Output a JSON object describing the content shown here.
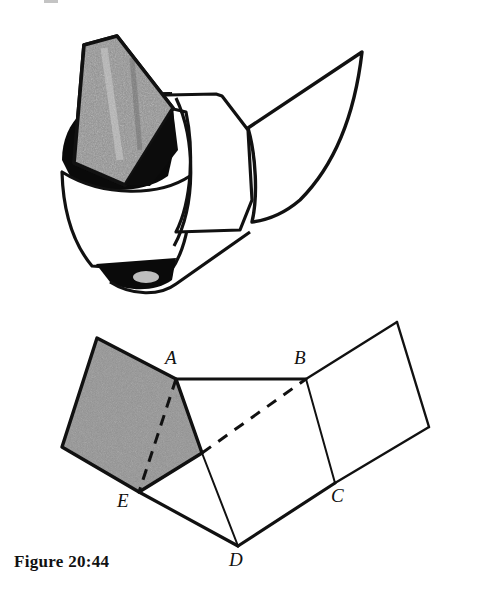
{
  "figure": {
    "caption": "Figure 20:44",
    "kind": "geometry-illustration",
    "panels": [
      {
        "name": "photo-model",
        "description": "folded paper model, perspective view"
      },
      {
        "name": "line-diagram",
        "description": "labelled net diagram of the folded model"
      }
    ]
  },
  "colors": {
    "ink": "#111111",
    "shaded_face": "#8d8d8d",
    "shadow_black": "#0a0a0a",
    "paper": "#ffffff",
    "texture_light": "#b9b9b9",
    "texture_dark": "#6a6a6a"
  },
  "diagram": {
    "vertices": [
      {
        "id": "A",
        "label": "A",
        "x": 176,
        "y": 379,
        "label_x": 165,
        "label_y": 351
      },
      {
        "id": "B",
        "label": "B",
        "x": 306,
        "y": 379,
        "label_x": 294,
        "label_y": 351
      },
      {
        "id": "C",
        "label": "C",
        "x": 335,
        "y": 483,
        "label_x": 331,
        "label_y": 489
      },
      {
        "id": "D",
        "label": "D",
        "x": 238,
        "y": 546,
        "label_x": 230,
        "label_y": 552
      },
      {
        "id": "E",
        "label": "E",
        "x": 139,
        "y": 492,
        "label_x": 118,
        "label_y": 494
      }
    ],
    "unlabelled_points": [
      {
        "id": "P_top",
        "x": 97,
        "y": 338
      },
      {
        "id": "P_left",
        "x": 62,
        "y": 447
      },
      {
        "id": "P_mid",
        "x": 202,
        "y": 453
      },
      {
        "id": "P_rtop",
        "x": 397,
        "y": 322
      },
      {
        "id": "P_rright",
        "x": 429,
        "y": 427
      }
    ],
    "shaded_face": {
      "name": "quad-shaded",
      "points": "97,338 176,379 202,453 139,492 62,447"
    },
    "solid_edges": [
      {
        "name": "edge-A-B",
        "from": "A",
        "to": "B"
      },
      {
        "name": "edge-top-A",
        "from": "P_top",
        "to": "A"
      },
      {
        "name": "edge-top-left",
        "from": "P_top",
        "to": "P_left"
      },
      {
        "name": "edge-left-E",
        "from": "P_left",
        "to": "E"
      },
      {
        "name": "edge-A-mid",
        "from": "A",
        "to": "P_mid"
      },
      {
        "name": "edge-mid-D",
        "from": "P_mid",
        "to": "D"
      },
      {
        "name": "edge-E-D",
        "from": "E",
        "to": "D"
      },
      {
        "name": "edge-E-mid",
        "from": "E",
        "to": "P_mid"
      },
      {
        "name": "edge-D-C",
        "from": "D",
        "to": "C"
      },
      {
        "name": "edge-B-C",
        "from": "B",
        "to": "C"
      },
      {
        "name": "edge-B-rtop",
        "from": "B",
        "to": "P_rtop"
      },
      {
        "name": "edge-rtop-rright",
        "from": "P_rtop",
        "to": "P_rright"
      },
      {
        "name": "edge-C-rright",
        "from": "C",
        "to": "P_rright"
      }
    ],
    "dashed_edges": [
      {
        "name": "fold-A-E",
        "from": "A",
        "to": "E"
      },
      {
        "name": "fold-mid-B",
        "from": "P_mid",
        "to": "B"
      }
    ]
  }
}
